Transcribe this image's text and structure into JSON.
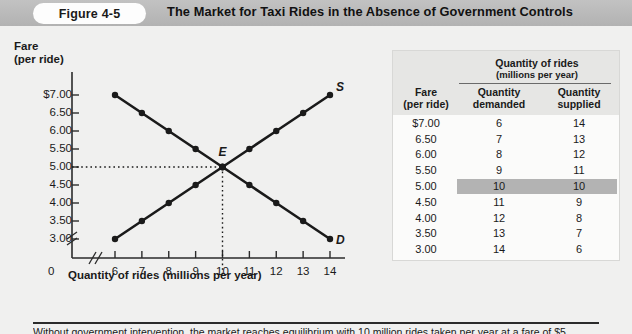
{
  "header": {
    "figure_badge": "Figure 4-5",
    "title": "The Market for Taxi Rides in the Absence of Government Controls"
  },
  "chart_data": {
    "type": "line",
    "title": "The Market for Taxi Rides in the Absence of Government Controls",
    "xlabel": "Quantity of rides (millions per year)",
    "ylabel": "Fare (per ride)",
    "ylabel_line1": "Fare",
    "ylabel_line2": "(per ride)",
    "x": [
      6,
      7,
      8,
      9,
      10,
      11,
      12,
      13,
      14
    ],
    "xtick_labels": [
      "6",
      "7",
      "8",
      "9",
      "10",
      "11",
      "12",
      "13",
      "14"
    ],
    "ytick_labels": [
      "$7.00",
      "6.50",
      "6.00",
      "5.50",
      "5.00",
      "4.50",
      "4.00",
      "3.50",
      "3.00"
    ],
    "ytick_values": [
      7.0,
      6.5,
      6.0,
      5.5,
      5.0,
      4.5,
      4.0,
      3.5,
      3.0
    ],
    "xlim": [
      6,
      14
    ],
    "ylim": [
      3.0,
      7.0
    ],
    "grid": false,
    "origin_label": "0",
    "axis_break_x": true,
    "axis_break_y": true,
    "series": [
      {
        "name": "D",
        "label": "D",
        "description": "Demand curve",
        "points": [
          {
            "x": 6,
            "y": 7.0
          },
          {
            "x": 7,
            "y": 6.5
          },
          {
            "x": 8,
            "y": 6.0
          },
          {
            "x": 9,
            "y": 5.5
          },
          {
            "x": 10,
            "y": 5.0
          },
          {
            "x": 11,
            "y": 4.5
          },
          {
            "x": 12,
            "y": 4.0
          },
          {
            "x": 13,
            "y": 3.5
          },
          {
            "x": 14,
            "y": 3.0
          }
        ]
      },
      {
        "name": "S",
        "label": "S",
        "description": "Supply curve",
        "points": [
          {
            "x": 6,
            "y": 3.0
          },
          {
            "x": 7,
            "y": 3.5
          },
          {
            "x": 8,
            "y": 4.0
          },
          {
            "x": 9,
            "y": 4.5
          },
          {
            "x": 10,
            "y": 5.0
          },
          {
            "x": 11,
            "y": 5.5
          },
          {
            "x": 12,
            "y": 6.0
          },
          {
            "x": 13,
            "y": 6.5
          },
          {
            "x": 14,
            "y": 7.0
          }
        ]
      }
    ],
    "annotations": [
      {
        "label": "E",
        "x": 10,
        "y": 5.0,
        "description": "Equilibrium point"
      }
    ]
  },
  "table": {
    "group_header": "Quantity of rides",
    "group_subheader": "(millions per year)",
    "columns": [
      {
        "line1": "Fare",
        "line2": "(per ride)"
      },
      {
        "line1": "Quantity",
        "line2": "demanded"
      },
      {
        "line1": "Quantity",
        "line2": "supplied"
      }
    ],
    "rows": [
      {
        "fare": "$7.00",
        "demanded": "6",
        "supplied": "14",
        "highlight": false
      },
      {
        "fare": "6.50",
        "demanded": "7",
        "supplied": "13",
        "highlight": false
      },
      {
        "fare": "6.00",
        "demanded": "8",
        "supplied": "12",
        "highlight": false
      },
      {
        "fare": "5.50",
        "demanded": "9",
        "supplied": "11",
        "highlight": false
      },
      {
        "fare": "5.00",
        "demanded": "10",
        "supplied": "10",
        "highlight": true
      },
      {
        "fare": "4.50",
        "demanded": "11",
        "supplied": "9",
        "highlight": false
      },
      {
        "fare": "4.00",
        "demanded": "12",
        "supplied": "8",
        "highlight": false
      },
      {
        "fare": "3.50",
        "demanded": "13",
        "supplied": "7",
        "highlight": false
      },
      {
        "fare": "3.00",
        "demanded": "14",
        "supplied": "6",
        "highlight": false
      }
    ]
  },
  "caption": {
    "text": "Without government intervention, the market reaches equilibrium with 10 million rides taken per year at a fare of $5"
  },
  "colors": {
    "header_bar": "#b8b8b8",
    "badge": "#fdfdfd",
    "curve": "#1a1a1a",
    "highlight_row": "#b3b3b3",
    "table_header": "#e6e6e4",
    "page_background": "#f0f0ef"
  }
}
